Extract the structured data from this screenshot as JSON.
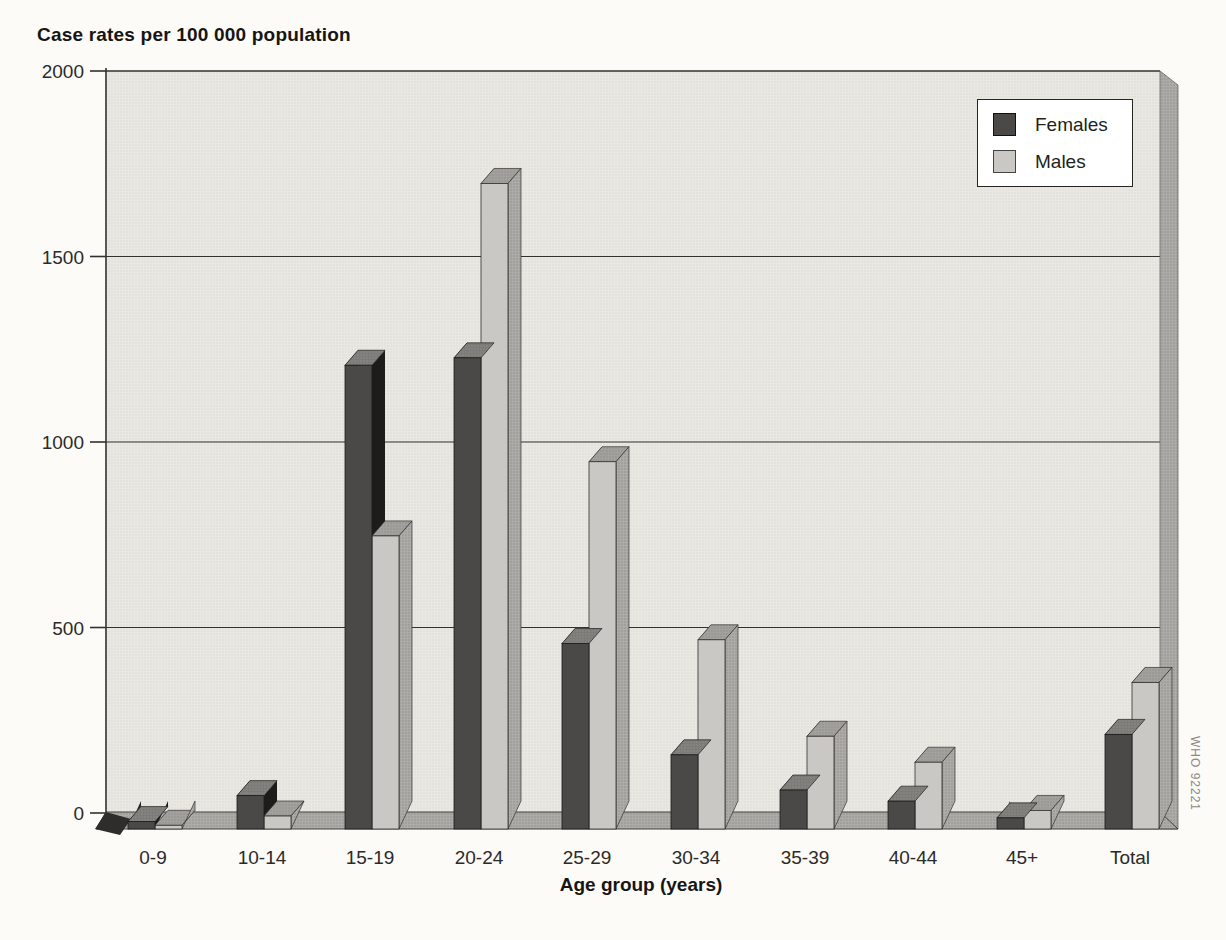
{
  "title": "Case rates per 100 000 population",
  "watermark": "WHO 92221",
  "legend": {
    "items": [
      {
        "label": "Females",
        "color": "#4a4947"
      },
      {
        "label": "Males",
        "color": "#cac8c4"
      }
    ]
  },
  "chart_data": {
    "type": "bar",
    "style": "3d-oblique-grouped",
    "title": "Case rates per 100 000 population",
    "xlabel": "Age group (years)",
    "ylabel": "Case rates per 100 000 population",
    "categories": [
      "0-9",
      "10-14",
      "15-19",
      "20-24",
      "25-29",
      "30-34",
      "35-39",
      "40-44",
      "45+",
      "Total"
    ],
    "series": [
      {
        "name": "Females",
        "values": [
          20,
          90,
          1250,
          1270,
          500,
          200,
          105,
          75,
          30,
          255
        ]
      },
      {
        "name": "Males",
        "values": [
          10,
          35,
          790,
          1740,
          990,
          510,
          250,
          180,
          50,
          395
        ]
      }
    ],
    "ylim": [
      0,
      2000
    ],
    "yticks": [
      0,
      500,
      1000,
      1500,
      2000
    ],
    "ytick_labels": [
      "0",
      "500",
      "1000",
      "1500",
      "2000"
    ],
    "grid": true,
    "legend_position": "top-right"
  },
  "colors": {
    "page": "#fcfbf8",
    "wall": "#e9e8e3",
    "wall_dot": "#dbdad4",
    "floor": "#aeaca8",
    "floor_dot": "#8d8b87",
    "female_front": "#4a4947",
    "female_top": "#7d7b78",
    "female_top_dot": "#918f8c",
    "female_side": "#232221",
    "male_front": "#cac8c4",
    "male_top": "#a3a19d",
    "male_top_dot": "#8f8d89",
    "dark_gap_side": "#1d1c1b",
    "line": "#33312f",
    "text": "#2b2a28",
    "watermark_text": "#8b8986"
  }
}
